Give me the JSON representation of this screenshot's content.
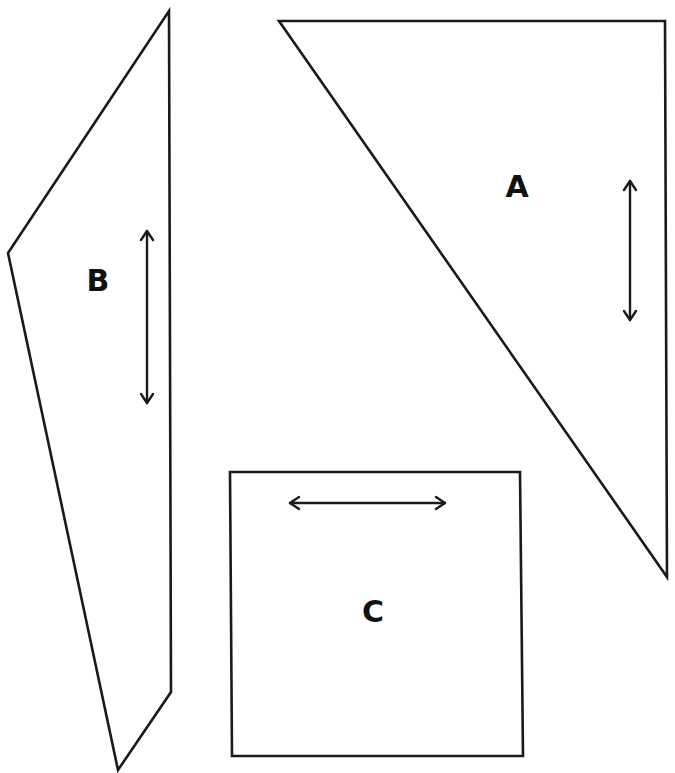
{
  "colors": {
    "stroke": "#1a1a1a",
    "background": "#ffffff"
  },
  "pieces": [
    {
      "id": "A",
      "label": "A",
      "shape": "triangle",
      "points": "279,21 665,21 667,577",
      "label_pos": [
        517,
        186
      ],
      "grainline": {
        "orientation": "vertical",
        "x1": 630,
        "y1": 181,
        "x2": 630,
        "y2": 320
      }
    },
    {
      "id": "B",
      "label": "B",
      "shape": "quadrilateral",
      "points": "169,11 171,692 118,770 8,253",
      "label_pos": [
        98,
        280
      ],
      "grainline": {
        "orientation": "vertical",
        "x1": 147,
        "y1": 231,
        "x2": 147,
        "y2": 403
      }
    },
    {
      "id": "C",
      "label": "C",
      "shape": "rectangle",
      "points": "230,472 520,472 523,756 232,756",
      "label_pos": [
        373,
        611
      ],
      "grainline": {
        "orientation": "horizontal",
        "x1": 290,
        "y1": 503,
        "x2": 445,
        "y2": 503
      }
    }
  ]
}
